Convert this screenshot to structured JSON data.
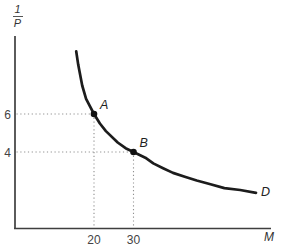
{
  "chart_data": {
    "type": "line",
    "title": "",
    "xlabel": "M",
    "ylabel": "1/P",
    "ylabel_numerator": "1",
    "ylabel_denominator": "P",
    "curve_label": "D",
    "xlim": [
      0,
      65
    ],
    "ylim": [
      0,
      10
    ],
    "grid": false,
    "legend": "none",
    "points": [
      {
        "label": "A",
        "x": 20,
        "y": 6
      },
      {
        "label": "B",
        "x": 30,
        "y": 4
      }
    ],
    "x_ticks": [
      "20",
      "30"
    ],
    "y_ticks": [
      "6",
      "4"
    ],
    "curve": [
      [
        15.5,
        9.3
      ],
      [
        16,
        8.6
      ],
      [
        17,
        7.5
      ],
      [
        18,
        6.8
      ],
      [
        19,
        6.4
      ],
      [
        20,
        6
      ],
      [
        21.5,
        5.5
      ],
      [
        23,
        5.1
      ],
      [
        26,
        4.5
      ],
      [
        28,
        4.2
      ],
      [
        30,
        4
      ],
      [
        33,
        3.7
      ],
      [
        35,
        3.4
      ],
      [
        37.5,
        3.15
      ],
      [
        40,
        2.9
      ],
      [
        43,
        2.7
      ],
      [
        46,
        2.5
      ],
      [
        49.5,
        2.3
      ],
      [
        53,
        2.1
      ],
      [
        57,
        2.0
      ],
      [
        61,
        1.85
      ]
    ],
    "colors": {
      "curve": "#1c1c1c",
      "axis": "#3f3f3f",
      "dotted": "#909090",
      "point": "#111111",
      "tick_text": "#444444",
      "label_text": "#1f1f1f"
    }
  }
}
